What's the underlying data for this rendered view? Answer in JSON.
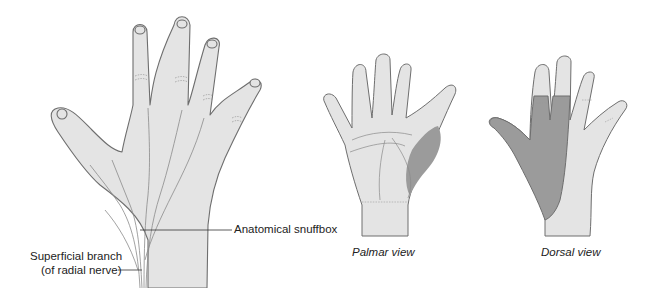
{
  "figure": {
    "labels": {
      "snuffbox": "Anatomical snuffbox",
      "superficial_line1": "Superficial branch",
      "superficial_line2": "(of radial nerve)"
    },
    "captions": {
      "palmar": "Palmar view",
      "dorsal": "Dorsal view"
    },
    "colors": {
      "skin": "#e4e4e4",
      "outline": "#6e6e6e",
      "shaded_territory": "#9b9b9b",
      "nerve": "#8a8a8a",
      "text": "#222222"
    }
  }
}
